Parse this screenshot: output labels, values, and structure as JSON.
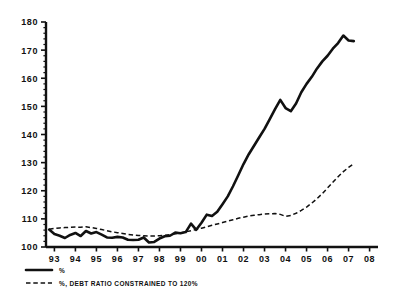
{
  "chart_data": {
    "type": "line",
    "title": "",
    "xlabel": "",
    "ylabel": "",
    "ylim": [
      100,
      180
    ],
    "xlim": [
      1992.6,
      2008.4
    ],
    "grid": false,
    "legend_position": "bottom-left",
    "y_ticks": [
      100,
      110,
      120,
      130,
      140,
      150,
      160,
      170,
      180
    ],
    "y_minor_tick_step": 2,
    "x_ticks": [
      1993,
      1994,
      1995,
      1996,
      1997,
      1998,
      1999,
      2000,
      2001,
      2002,
      2003,
      2004,
      2005,
      2006,
      2007,
      2008
    ],
    "x_tick_labels": [
      "93",
      "94",
      "95",
      "96",
      "97",
      "98",
      "99",
      "00",
      "01",
      "02",
      "03",
      "04",
      "05",
      "06",
      "07",
      "08"
    ],
    "series": [
      {
        "name": "%",
        "style": "solid",
        "color": "#111111",
        "x": [
          1992.75,
          1993.0,
          1993.25,
          1993.5,
          1993.75,
          1994.0,
          1994.25,
          1994.5,
          1994.75,
          1995.0,
          1995.25,
          1995.5,
          1995.75,
          1996.0,
          1996.25,
          1996.5,
          1996.75,
          1997.0,
          1997.25,
          1997.5,
          1997.75,
          1998.0,
          1998.25,
          1998.5,
          1998.75,
          1999.0,
          1999.25,
          1999.5,
          1999.75,
          2000.0,
          2000.25,
          2000.5,
          2000.75,
          2001.0,
          2001.25,
          2001.5,
          2001.75,
          2002.0,
          2002.25,
          2002.5,
          2002.75,
          2003.0,
          2003.25,
          2003.5,
          2003.75,
          2004.0,
          2004.25,
          2004.5,
          2004.75,
          2005.0,
          2005.25,
          2005.5,
          2005.75,
          2006.0,
          2006.25,
          2006.5,
          2006.75,
          2007.0,
          2007.25
        ],
        "values": [
          106.2,
          104.6,
          104.0,
          103.2,
          104.3,
          105.0,
          103.9,
          105.7,
          104.8,
          105.3,
          104.4,
          103.4,
          103.3,
          103.6,
          103.4,
          102.6,
          102.5,
          102.6,
          103.4,
          101.6,
          101.8,
          103.0,
          103.8,
          104.0,
          105.1,
          104.9,
          105.3,
          108.3,
          106.1,
          108.6,
          111.5,
          111.0,
          112.5,
          115.2,
          118.0,
          121.6,
          125.5,
          129.5,
          133.0,
          136.0,
          139.0,
          142.0,
          145.5,
          149.0,
          152.3,
          149.4,
          148.3,
          151.0,
          155.0,
          158.0,
          160.5,
          163.5,
          166.0,
          168.0,
          170.5,
          172.5,
          175.2,
          173.4,
          173.2
        ]
      },
      {
        "name": "%, DEBT RATIO CONSTRAINED TO 120%",
        "style": "dashed",
        "color": "#111111",
        "x": [
          1992.75,
          1993.0,
          1993.25,
          1993.5,
          1993.75,
          1994.0,
          1994.25,
          1994.5,
          1994.75,
          1995.0,
          1995.25,
          1995.5,
          1995.75,
          1996.0,
          1996.25,
          1996.5,
          1996.75,
          1997.0,
          1997.25,
          1997.5,
          1997.75,
          1998.0,
          1998.25,
          1998.5,
          1998.75,
          1999.0,
          1999.25,
          1999.5,
          1999.75,
          2000.0,
          2000.25,
          2000.5,
          2000.75,
          2001.0,
          2001.25,
          2001.5,
          2001.75,
          2002.0,
          2002.25,
          2002.5,
          2002.75,
          2003.0,
          2003.25,
          2003.5,
          2003.75,
          2004.0,
          2004.25,
          2004.5,
          2004.75,
          2005.0,
          2005.25,
          2005.5,
          2005.75,
          2006.0,
          2006.25,
          2006.5,
          2006.75,
          2007.0,
          2007.25
        ],
        "values": [
          106.3,
          106.6,
          106.8,
          106.9,
          107.0,
          107.1,
          107.0,
          107.2,
          106.9,
          106.6,
          106.2,
          105.8,
          105.4,
          105.1,
          104.8,
          104.5,
          104.3,
          104.1,
          104.0,
          103.9,
          103.9,
          104.0,
          104.2,
          104.4,
          104.7,
          105.0,
          105.4,
          105.8,
          106.2,
          106.7,
          107.2,
          107.7,
          108.2,
          108.7,
          109.2,
          109.7,
          110.2,
          110.6,
          111.0,
          111.3,
          111.5,
          111.7,
          111.8,
          111.9,
          111.6,
          110.9,
          111.2,
          112.0,
          113.0,
          114.2,
          115.6,
          117.2,
          119.0,
          121.0,
          123.0,
          125.0,
          126.8,
          128.3,
          129.6
        ]
      }
    ],
    "legend": [
      {
        "label": "%",
        "style": "solid"
      },
      {
        "label": "%, DEBT RATIO CONSTRAINED TO 120%",
        "style": "dashed"
      }
    ]
  }
}
